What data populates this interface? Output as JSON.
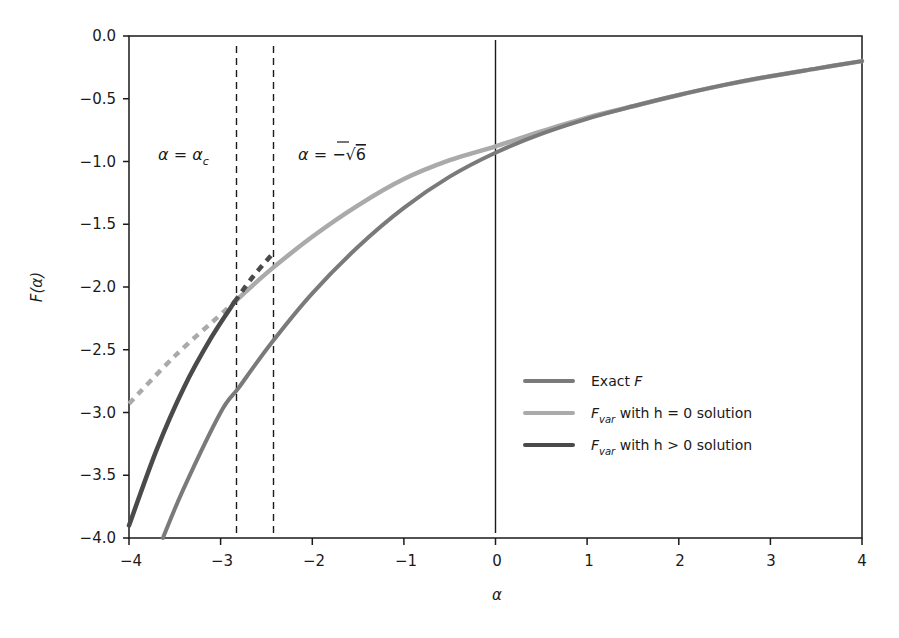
{
  "chart_data": {
    "type": "line",
    "title": "",
    "xlabel": "α",
    "ylabel": "F(α)",
    "xlim": [
      -4,
      4
    ],
    "ylim": [
      -4.0,
      0.0
    ],
    "grid": false,
    "legend_position": "lower right (inside)",
    "x_ticks": [
      "-4",
      "-3",
      "-2",
      "-1",
      "0",
      "1",
      "2",
      "3",
      "4"
    ],
    "y_ticks": [
      "0.0",
      "-0.5",
      "-1.0",
      "-1.5",
      "-2.0",
      "-2.5",
      "-3.0",
      "-3.5",
      "-4.0"
    ],
    "series": [
      {
        "name": "Exact F",
        "color": "#7a7a7a",
        "style": "solid",
        "x": [
          -3.63,
          -3.4,
          -3.0,
          -2.8,
          -2.45,
          -2.0,
          -1.5,
          -1.0,
          -0.5,
          0.0,
          0.5,
          1.0,
          1.5,
          2.0,
          2.5,
          3.0,
          3.5,
          4.0
        ],
        "y": [
          -4.0,
          -3.6,
          -3.0,
          -2.8,
          -2.45,
          -2.05,
          -1.68,
          -1.37,
          -1.12,
          -0.93,
          -0.78,
          -0.66,
          -0.56,
          -0.47,
          -0.39,
          -0.32,
          -0.26,
          -0.2
        ]
      },
      {
        "name": "F_var with h = 0 solution",
        "color": "#aaaaaa",
        "segments": [
          {
            "style": "dashed",
            "x": [
              -4.0,
              -3.5,
              -3.0,
              -2.85
            ],
            "y": [
              -2.93,
              -2.55,
              -2.22,
              -2.12
            ]
          },
          {
            "style": "solid",
            "x": [
              -2.85,
              -2.45,
              -2.0,
              -1.5,
              -1.0,
              -0.5,
              0.0,
              0.5,
              1.0,
              1.5,
              2.0,
              2.5,
              3.0,
              3.5,
              4.0
            ],
            "y": [
              -2.12,
              -1.86,
              -1.6,
              -1.35,
              -1.14,
              -0.99,
              -0.88,
              -0.76,
              -0.65,
              -0.56,
              -0.47,
              -0.39,
              -0.32,
              -0.26,
              -0.2
            ]
          }
        ]
      },
      {
        "name": "F_var with h > 0 solution",
        "color": "#4a4a4a",
        "segments": [
          {
            "style": "solid",
            "x": [
              -4.0,
              -3.7,
              -3.4,
              -3.1,
              -2.85
            ],
            "y": [
              -3.9,
              -3.3,
              -2.8,
              -2.4,
              -2.12
            ]
          },
          {
            "style": "dashed",
            "x": [
              -2.85,
              -2.65,
              -2.45
            ],
            "y": [
              -2.12,
              -1.92,
              -1.75
            ]
          }
        ]
      }
    ],
    "reference_lines": [
      {
        "type": "vertical",
        "x": -2.85,
        "style": "dashed",
        "label": "α = α_c"
      },
      {
        "type": "vertical",
        "x": -2.449,
        "style": "dashed",
        "label": "α = −√6"
      },
      {
        "type": "vertical",
        "x": 0.0,
        "style": "solid",
        "label": ""
      }
    ],
    "annotations": [
      {
        "text": "α = α",
        "subscript": "c",
        "x": -3.75,
        "y": -1.0
      },
      {
        "text": "α = −√6",
        "x": -2.3,
        "y": -1.0
      }
    ],
    "legend": [
      {
        "label_main": "Exact F",
        "label_sub": "",
        "label_rest": "",
        "color": "#7a7a7a"
      },
      {
        "label_main": "F",
        "label_sub": "var",
        "label_rest": " with h = 0 solution",
        "color": "#aaaaaa"
      },
      {
        "label_main": "F",
        "label_sub": "var",
        "label_rest": " with h > 0 solution",
        "color": "#4a4a4a"
      }
    ]
  },
  "annotations": {
    "alpha_c": {
      "main": "α = α",
      "sub": "c"
    },
    "sqrt6": {
      "prefix": "α = −",
      "root": "√",
      "value": "6"
    }
  },
  "legend": {
    "items": [
      {
        "main": "Exact ",
        "italic": "F",
        "sub": "",
        "rest": ""
      },
      {
        "main": "",
        "italic": "F",
        "sub": "var",
        "rest": " with h = 0 solution"
      },
      {
        "main": "",
        "italic": "F",
        "sub": "var",
        "rest": " with h > 0 solution"
      }
    ]
  },
  "axes": {
    "xlabel": "α",
    "ylabel": "F(α)",
    "x_ticks": [
      "−4",
      "−3",
      "−2",
      "−1",
      "0",
      "1",
      "2",
      "3",
      "4"
    ],
    "y_ticks": [
      "0.0",
      "−0.5",
      "−1.0",
      "−1.5",
      "−2.0",
      "−2.5",
      "−3.0",
      "−3.5",
      "−4.0"
    ]
  }
}
